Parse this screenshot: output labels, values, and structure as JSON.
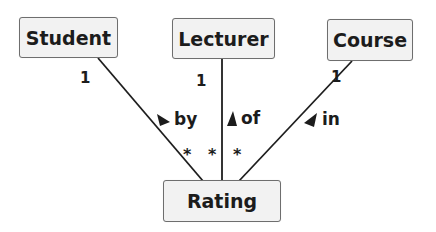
{
  "diagram": {
    "type": "uml-class-diagram",
    "entities": [
      {
        "id": "student",
        "label": "Student"
      },
      {
        "id": "lecturer",
        "label": "Lecturer"
      },
      {
        "id": "course",
        "label": "Course"
      },
      {
        "id": "rating",
        "label": "Rating"
      }
    ],
    "associations": [
      {
        "from": "student",
        "to": "rating",
        "role": "by",
        "direction_icon": "arrow-down-right-icon",
        "from_multiplicity": "1",
        "to_multiplicity": "*"
      },
      {
        "from": "lecturer",
        "to": "rating",
        "role": "of",
        "direction_icon": "arrow-up-icon",
        "from_multiplicity": "1",
        "to_multiplicity": "*"
      },
      {
        "from": "course",
        "to": "rating",
        "role": "in",
        "direction_icon": "arrow-down-left-icon",
        "from_multiplicity": "1",
        "to_multiplicity": "*"
      }
    ],
    "colors": {
      "box_fill": "#f2f2f2",
      "box_border": "#6e6e6e",
      "line": "#1e1e1e",
      "text": "#1c1c1c"
    }
  }
}
